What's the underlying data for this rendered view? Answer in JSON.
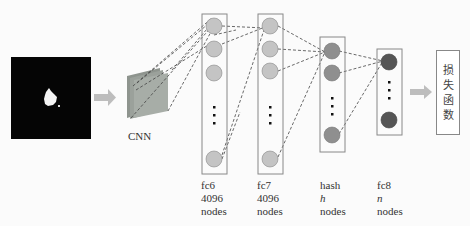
{
  "diagram": {
    "type": "neural-network-architecture",
    "input": {
      "label": "",
      "description": "black image with white blob"
    },
    "cnn": {
      "label": "CNN"
    },
    "layers": [
      {
        "name": "fc6",
        "size": "4096",
        "unit": "nodes",
        "size_italic": false
      },
      {
        "name": "fc7",
        "size": "4096",
        "unit": "nodes",
        "size_italic": false
      },
      {
        "name": "hash",
        "size": "h",
        "unit": "nodes",
        "size_italic": true
      },
      {
        "name": "fc8",
        "size": "n",
        "unit": "nodes",
        "size_italic": true
      }
    ],
    "loss": {
      "chars": [
        "损",
        "失",
        "函",
        "数"
      ],
      "label": "损失函数"
    },
    "colors": {
      "fc_node": "#c4c4c4",
      "hash_node": "#8f8f8f",
      "fc8_node": "#555555",
      "arrow": "#b8b8b8",
      "cnn_plate": "#9aa09a",
      "box_border": "#888888"
    }
  }
}
